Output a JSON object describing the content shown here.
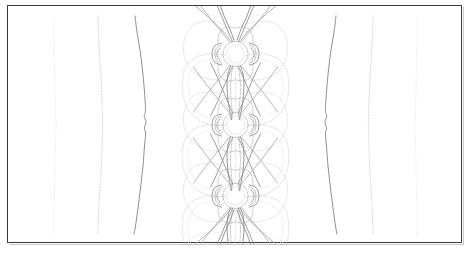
{
  "figure": {
    "title": "",
    "caption": "",
    "width": 474,
    "height": 254,
    "background_color": "#ffffff",
    "frame_color": "#3a3a3e",
    "frame_linewidth": 1
  },
  "chart_data": {
    "type": "line",
    "plot_kind": "contour",
    "title": "",
    "subtitle": "",
    "xlabel": "",
    "ylabel": "",
    "xlim": [
      0,
      455
    ],
    "ylim": [
      0,
      238
    ],
    "grid": false,
    "legend": null,
    "tick_labels_x": [],
    "tick_labels_y": [],
    "annotations": [],
    "symmetry": "mirror about vertical centerline x=227.5; periodic in y with 3 cells",
    "contour_colors": {
      "faintest": "#e2e2e6",
      "faint": "#cfcfd4",
      "mid": "#aaaab0",
      "strong": "#8a8a90",
      "strongest": "#5e5e66"
    },
    "series": [
      {
        "name": "outer-contour-level-1-left",
        "color": "#e4e4e8",
        "linewidth": 0.8,
        "dash": "1,2",
        "points": [
          [
            46,
            10
          ],
          [
            46,
            30
          ],
          [
            46.5,
            55
          ],
          [
            47,
            80
          ],
          [
            47.5,
            105
          ],
          [
            48,
            119
          ],
          [
            47.5,
            135
          ],
          [
            47,
            160
          ],
          [
            46.5,
            185
          ],
          [
            46,
            210
          ],
          [
            46,
            228
          ]
        ]
      },
      {
        "name": "outer-contour-level-2-left",
        "color": "#c8c8ce",
        "linewidth": 0.9,
        "dash": "1,2",
        "points": [
          [
            90,
            10
          ],
          [
            90.5,
            28
          ],
          [
            91.5,
            50
          ],
          [
            93,
            72
          ],
          [
            94,
            95
          ],
          [
            94.6,
            119
          ],
          [
            94,
            143
          ],
          [
            93,
            166
          ],
          [
            91.5,
            188
          ],
          [
            90.5,
            210
          ],
          [
            90,
            228
          ]
        ]
      },
      {
        "name": "outer-contour-level-3-left",
        "color": "#8e8e96",
        "linewidth": 1.0,
        "dash": "none",
        "points": [
          [
            127,
            10
          ],
          [
            129,
            26
          ],
          [
            132,
            44
          ],
          [
            134.5,
            64
          ],
          [
            136.5,
            86
          ],
          [
            137.5,
            104
          ],
          [
            136.2,
            110
          ],
          [
            138,
            116
          ],
          [
            136.4,
            122
          ],
          [
            137.6,
            128
          ],
          [
            136.5,
            140
          ],
          [
            135,
            160
          ],
          [
            132.5,
            182
          ],
          [
            130,
            202
          ],
          [
            127.5,
            220
          ],
          [
            126,
            228
          ]
        ]
      },
      {
        "name": "outer-contour-level-3-right",
        "color": "#8e8e96",
        "linewidth": 1.0,
        "dash": "none",
        "points": [
          [
            328,
            10
          ],
          [
            326,
            26
          ],
          [
            323,
            44
          ],
          [
            320.5,
            64
          ],
          [
            318.5,
            86
          ],
          [
            317.5,
            104
          ],
          [
            318.8,
            110
          ],
          [
            317,
            116
          ],
          [
            318.6,
            122
          ],
          [
            317.4,
            128
          ],
          [
            318.5,
            140
          ],
          [
            320,
            160
          ],
          [
            322.5,
            182
          ],
          [
            325,
            202
          ],
          [
            327.5,
            220
          ],
          [
            329,
            228
          ]
        ]
      },
      {
        "name": "outer-contour-level-2-right",
        "color": "#c8c8ce",
        "linewidth": 0.9,
        "dash": "1,2",
        "points": [
          [
            365,
            10
          ],
          [
            364.5,
            28
          ],
          [
            363.5,
            50
          ],
          [
            362,
            72
          ],
          [
            361,
            95
          ],
          [
            360.4,
            119
          ],
          [
            361,
            143
          ],
          [
            362,
            166
          ],
          [
            363.5,
            188
          ],
          [
            364.5,
            210
          ],
          [
            365,
            228
          ]
        ]
      },
      {
        "name": "outer-contour-level-1-right",
        "color": "#e4e4e8",
        "linewidth": 0.8,
        "dash": "1,2",
        "points": [
          [
            409,
            10
          ],
          [
            409,
            30
          ],
          [
            408.5,
            55
          ],
          [
            408,
            80
          ],
          [
            407.5,
            105
          ],
          [
            407,
            119
          ],
          [
            407.5,
            135
          ],
          [
            408,
            160
          ],
          [
            408.5,
            185
          ],
          [
            409,
            210
          ],
          [
            409,
            228
          ]
        ]
      }
    ],
    "core_structure": {
      "description": "vertically periodic bowtie/butterfly contour cells along the centerline",
      "center_x": 227.5,
      "cell_centers_y": [
        48,
        119,
        190
      ],
      "cell_height": 71,
      "features": [
        "circular node ring at each cell center",
        "crescent lobes flanking each node",
        "large rounded wing lobes left and right between nodes",
        "fan of separatrix lines diverging at top and bottom edges",
        "narrow vertical waist channel connecting successive nodes"
      ]
    }
  }
}
